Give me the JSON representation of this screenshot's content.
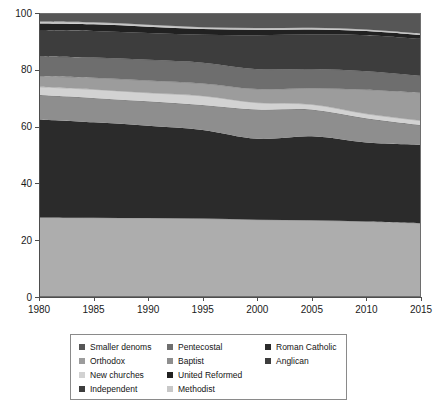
{
  "chart_data": {
    "type": "area",
    "title": "",
    "xlabel": "",
    "ylabel": "",
    "x": [
      1980,
      1985,
      1990,
      1995,
      2000,
      2005,
      2010,
      2015
    ],
    "xlim": [
      1980,
      2015
    ],
    "ylim": [
      0,
      100
    ],
    "xticks": [
      "1980",
      "1985",
      "1990",
      "1995",
      "2000",
      "2005",
      "2010",
      "2015"
    ],
    "yticks": [
      "0",
      "20",
      "40",
      "60",
      "80",
      "100"
    ],
    "grid": false,
    "stacked": true,
    "stack_order_bottom_to_top": [
      "Anglican",
      "Roman Catholic",
      "Baptist",
      "New churches",
      "Orthodox",
      "Pentecostal",
      "Independent",
      "United Reformed",
      "Methodist",
      "Smaller denoms"
    ],
    "legend_position": "below-chart",
    "series": [
      {
        "name": "Anglican",
        "color": "#adadad",
        "values": [
          28.0,
          27.9,
          27.8,
          27.6,
          27.2,
          27.0,
          26.6,
          26.0
        ]
      },
      {
        "name": "Roman Catholic",
        "color": "#2b2b2b",
        "values": [
          34.5,
          33.6,
          32.5,
          31.2,
          28.5,
          29.6,
          27.8,
          27.6
        ]
      },
      {
        "name": "Baptist",
        "color": "#8e8e8e",
        "values": [
          8.6,
          8.6,
          8.6,
          8.8,
          10.3,
          9.4,
          8.5,
          6.9
        ]
      },
      {
        "name": "New churches",
        "color": "#d2d2d2",
        "values": [
          2.9,
          3.0,
          3.0,
          3.2,
          2.4,
          1.8,
          1.6,
          1.6
        ]
      },
      {
        "name": "Orthodox",
        "color": "#9c9c9c",
        "values": [
          3.8,
          4.1,
          4.3,
          4.4,
          4.8,
          5.7,
          8.5,
          9.8
        ]
      },
      {
        "name": "Pentecostal",
        "color": "#6e6e6e",
        "values": [
          6.9,
          7.1,
          7.3,
          7.3,
          7.0,
          6.8,
          6.5,
          6.0
        ]
      },
      {
        "name": "Independent",
        "color": "#3d3d3d",
        "values": [
          9.3,
          9.4,
          9.5,
          9.8,
          12.0,
          12.1,
          12.7,
          13.0
        ]
      },
      {
        "name": "United Reformed",
        "color": "#212121",
        "values": [
          2.3,
          2.3,
          2.2,
          2.1,
          1.9,
          1.8,
          1.5,
          1.4
        ]
      },
      {
        "name": "Methodist",
        "color": "#c8c8c8",
        "values": [
          0.7,
          0.7,
          0.7,
          0.6,
          0.6,
          0.6,
          0.5,
          0.5
        ]
      },
      {
        "name": "Smaller denoms",
        "color": "#565656",
        "values": [
          3.0,
          3.3,
          4.1,
          5.0,
          5.3,
          5.2,
          5.8,
          7.2
        ]
      }
    ]
  },
  "axes": {
    "y_tick_0": "0",
    "y_tick_1": "20",
    "y_tick_2": "40",
    "y_tick_3": "60",
    "y_tick_4": "80",
    "y_tick_5": "100",
    "x_tick_0": "1980",
    "x_tick_1": "1985",
    "x_tick_2": "1990",
    "x_tick_3": "1995",
    "x_tick_4": "2000",
    "x_tick_5": "2005",
    "x_tick_6": "2010",
    "x_tick_7": "2015"
  },
  "legend": {
    "items": [
      {
        "label": "Smaller denoms",
        "color": "#565656",
        "col": 0,
        "row": 0
      },
      {
        "label": "Pentecostal",
        "color": "#6e6e6e",
        "col": 1,
        "row": 0
      },
      {
        "label": "Roman Catholic",
        "color": "#2b2b2b",
        "col": 2,
        "row": 0
      },
      {
        "label": "Orthodox",
        "color": "#9c9c9c",
        "col": 0,
        "row": 1
      },
      {
        "label": "Baptist",
        "color": "#8e8e8e",
        "col": 1,
        "row": 1
      },
      {
        "label": "Anglican",
        "color": "#3d3d3d",
        "col": 2,
        "row": 1
      },
      {
        "label": "New churches",
        "color": "#d2d2d2",
        "col": 0,
        "row": 2
      },
      {
        "label": "United Reformed",
        "color": "#212121",
        "col": 1,
        "row": 2
      },
      {
        "label": "Independent",
        "color": "#3d3d3d",
        "col": 0,
        "row": 3
      },
      {
        "label": "Methodist",
        "color": "#c8c8c8",
        "col": 1,
        "row": 3
      }
    ]
  },
  "colors": {
    "axis": "#4d4d4d",
    "plot_border": "#6e6e6e",
    "background": "#ffffff",
    "text": "#141414"
  }
}
